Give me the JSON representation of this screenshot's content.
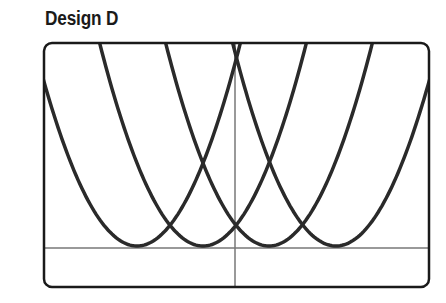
{
  "title": "Design D",
  "chart_data": {
    "type": "line",
    "title": "Design D",
    "xlabel": "",
    "ylabel": "",
    "grid": false,
    "axes": {
      "x_axis_pixel_y": 248,
      "y_axis_pixel_x": 235
    },
    "frame": {
      "left": 44,
      "top": 43,
      "right": 429,
      "bottom": 287,
      "radius": 8
    },
    "series": [
      {
        "name": "parabola-1",
        "vertex_px": [
          137,
          246
        ],
        "k": 0.019
      },
      {
        "name": "parabola-2",
        "vertex_px": [
          203,
          246
        ],
        "k": 0.019
      },
      {
        "name": "parabola-3",
        "vertex_px": [
          269,
          246
        ],
        "k": 0.019
      },
      {
        "name": "parabola-4",
        "vertex_px": [
          336,
          246
        ],
        "k": 0.019
      }
    ],
    "colors": {
      "curve": "#2a2a2a",
      "axis": "#777777",
      "frame": "#1a1a1a"
    }
  }
}
